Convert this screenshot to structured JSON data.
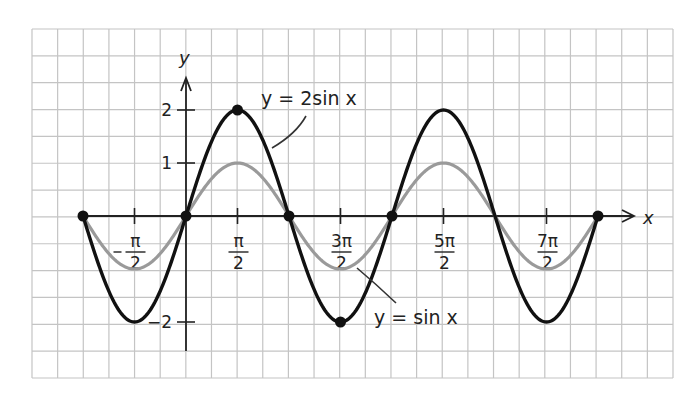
{
  "chart_data": {
    "type": "line",
    "title": "",
    "xlabel": "x",
    "ylabel": "y",
    "xlim": [
      -3.1416,
      12.5664
    ],
    "ylim": [
      -2,
      2
    ],
    "grid": true,
    "legend": "annotations on curves",
    "x_ticks": [
      {
        "value": -1.5708,
        "num": "π",
        "den": "2",
        "sign": "−"
      },
      {
        "value": 1.5708,
        "num": "π",
        "den": "2",
        "sign": ""
      },
      {
        "value": 4.7124,
        "num": "3π",
        "den": "2",
        "sign": ""
      },
      {
        "value": 7.854,
        "num": "5π",
        "den": "2",
        "sign": ""
      },
      {
        "value": 10.9956,
        "num": "7π",
        "den": "2",
        "sign": ""
      }
    ],
    "y_ticks": [
      {
        "value": 2,
        "label": "2"
      },
      {
        "value": 1,
        "label": "1"
      },
      {
        "value": -2,
        "label": "-2"
      }
    ],
    "series": [
      {
        "name": "y = sin x",
        "function": "sin(x)",
        "color": "#9a9a9a",
        "x": [
          -3.1416,
          -1.5708,
          0,
          1.5708,
          3.1416,
          4.7124,
          6.2832,
          7.854,
          9.4248,
          10.9956,
          12.5664
        ],
        "values": [
          0,
          -1,
          0,
          1,
          0,
          -1,
          0,
          1,
          0,
          -1,
          0
        ]
      },
      {
        "name": "y = 2sin x",
        "function": "2*sin(x)",
        "color": "#111111",
        "x": [
          -3.1416,
          -1.5708,
          0,
          1.5708,
          3.1416,
          4.7124,
          6.2832,
          7.854,
          9.4248,
          10.9956,
          12.5664
        ],
        "values": [
          0,
          -2,
          0,
          2,
          0,
          -2,
          0,
          2,
          0,
          -2,
          0
        ]
      }
    ],
    "marked_points": [
      {
        "x": -3.1416,
        "y": 0
      },
      {
        "x": 0,
        "y": 0
      },
      {
        "x": 1.5708,
        "y": 2
      },
      {
        "x": 3.1416,
        "y": 0
      },
      {
        "x": 4.7124,
        "y": -2
      },
      {
        "x": 6.2832,
        "y": 0
      },
      {
        "x": 12.5664,
        "y": 0
      }
    ],
    "annotations": [
      {
        "text": "y = 2sin x",
        "target": "y = 2sin x"
      },
      {
        "text": "y = sin x",
        "target": "y = sin x"
      }
    ]
  },
  "labels": {
    "x_axis": "x",
    "y_axis": "y",
    "curve_2sin": "y = 2sin x",
    "curve_sin": "y = sin x"
  },
  "colors": {
    "grid": "#c4c4c4",
    "axis": "#222222",
    "sin": "#9a9a9a",
    "two_sin": "#111111"
  }
}
